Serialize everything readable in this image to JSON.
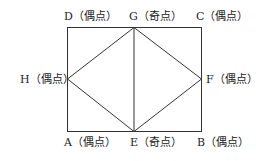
{
  "diagram": {
    "colors": {
      "line": "#333333",
      "text": "#222222",
      "background": "#ffffff"
    },
    "points": {
      "A": {
        "label": "A（偶点）"
      },
      "B": {
        "label": "B（偶点）"
      },
      "C": {
        "label": "C（偶点）"
      },
      "D": {
        "label": "D（偶点）"
      },
      "E": {
        "label": "E（奇点）"
      },
      "F": {
        "label": "F（偶点）"
      },
      "G": {
        "label": "G（奇点）"
      },
      "H": {
        "label": "H（偶点）"
      }
    },
    "edges": [
      [
        "A",
        "B"
      ],
      [
        "B",
        "C"
      ],
      [
        "C",
        "D"
      ],
      [
        "D",
        "A"
      ],
      [
        "G",
        "E"
      ],
      [
        "G",
        "H"
      ],
      [
        "H",
        "E"
      ],
      [
        "G",
        "F"
      ],
      [
        "F",
        "E"
      ]
    ]
  }
}
